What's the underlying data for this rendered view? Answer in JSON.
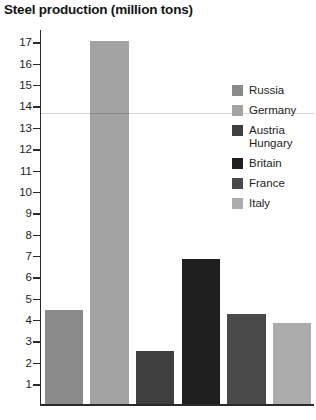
{
  "chart_data": {
    "type": "bar",
    "title": "Steel production (million tons)",
    "xlabel": "",
    "ylabel": "",
    "categories": [
      "Russia",
      "Germany",
      "Austria Hungary",
      "Britain",
      "France",
      "Italy"
    ],
    "values": [
      4.4,
      17.0,
      2.5,
      6.8,
      4.2,
      3.8
    ],
    "series": [
      {
        "name": "Steel production (million tons)",
        "values": [
          4.4,
          17.0,
          2.5,
          6.8,
          4.2,
          3.8
        ]
      }
    ],
    "colors": [
      "#8a8a8a",
      "#a3a3a3",
      "#3f3f3f",
      "#1f1f1f",
      "#4a4a4a",
      "#ababab"
    ],
    "ylim": [
      0,
      17.6
    ],
    "yticks": [
      17,
      16,
      15,
      14,
      13,
      12,
      11,
      10,
      9,
      8,
      7,
      6,
      5,
      4,
      3,
      2,
      1
    ],
    "ytick_labels": [
      "17",
      "16",
      "15",
      "14",
      "13",
      "12",
      "11",
      "10",
      "9",
      "8",
      "7",
      "6",
      "5",
      "4",
      "3",
      "2",
      "1"
    ],
    "grid": false,
    "legend_position": "inside-right",
    "legend": [
      {
        "label": "Russia",
        "color": "#8a8a8a"
      },
      {
        "label": "Germany",
        "color": "#a3a3a3"
      },
      {
        "label": "Austria\nHungary",
        "color": "#3f3f3f"
      },
      {
        "label": "Britain",
        "color": "#1f1f1f"
      },
      {
        "label": "France",
        "color": "#4a4a4a"
      },
      {
        "label": "Italy",
        "color": "#ababab"
      }
    ]
  }
}
